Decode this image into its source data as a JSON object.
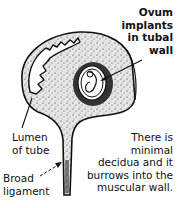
{
  "diagram": {
    "labels": {
      "ovum": [
        "Ovum",
        "implants",
        "in tubal",
        "wall"
      ],
      "lumen": [
        "Lumen",
        "of tube"
      ],
      "broad_ligament": [
        "Broad",
        "ligament"
      ],
      "note": [
        "There is",
        "minimal",
        "decidua and it",
        "burrows into the",
        "muscular wall."
      ]
    },
    "colors": {
      "ink": "#111111",
      "background": "#ffffff",
      "tissue_fill": "#d9d9d9"
    }
  }
}
